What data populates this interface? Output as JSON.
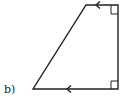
{
  "figure": {
    "label": "b)",
    "shape": "trapezoid",
    "features": {
      "parallel_sides": [
        "top",
        "bottom"
      ],
      "parallel_arrow_icon": "arrowhead-left",
      "right_angles": [
        "top-right",
        "bottom-right"
      ]
    },
    "colors": {
      "stroke": "#222222",
      "background": "#ffffff"
    }
  }
}
